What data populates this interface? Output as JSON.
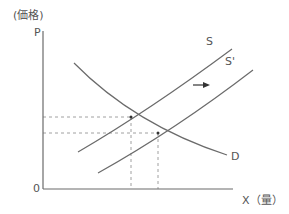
{
  "axes": {
    "y_label": "(価格)",
    "y_symbol": "P",
    "origin": "0",
    "x_label": "X（量）"
  },
  "curves": {
    "supply": "S",
    "supply_shifted": "S'",
    "demand": "D"
  },
  "annotation": {
    "shift_arrow": "right-arrow"
  },
  "colors": {
    "line": "#6b6b6b",
    "dashed": "#9a9a9a",
    "text": "#555555"
  }
}
